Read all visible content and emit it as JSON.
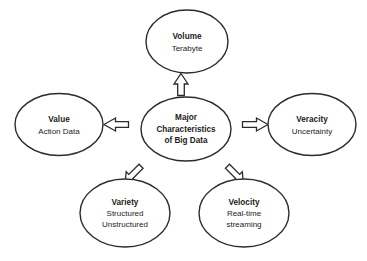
{
  "diagram": {
    "type": "hub-and-spoke",
    "background_color": "#ffffff",
    "stroke_color": "#2b2b2b",
    "center": {
      "name": "major-characteristics-of-big-data",
      "lines": [
        "Major",
        "Characteristics",
        "of Big Data"
      ],
      "line1": "Major",
      "line2": "Characteristics",
      "line3": "of Big Data"
    },
    "nodes": [
      {
        "id": "volume",
        "title": "Volume",
        "sub1": "Terabyte",
        "sub2": "",
        "position": "top",
        "arrow_direction": "up"
      },
      {
        "id": "value",
        "title": "Value",
        "sub1": "Action Data",
        "sub2": "",
        "position": "left",
        "arrow_direction": "left"
      },
      {
        "id": "veracity",
        "title": "Veracity",
        "sub1": "Uncertainty",
        "sub2": "",
        "position": "right",
        "arrow_direction": "right"
      },
      {
        "id": "variety",
        "title": "Variety",
        "sub1": "Structured",
        "sub2": "Unstructured",
        "position": "bottom-left",
        "arrow_direction": "down-left"
      },
      {
        "id": "velocity",
        "title": "Velocity",
        "sub1": "Real-time",
        "sub2": "streaming",
        "position": "bottom-right",
        "arrow_direction": "down-right"
      }
    ]
  }
}
